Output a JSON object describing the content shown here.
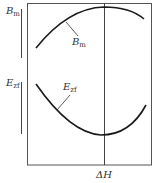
{
  "diagram": {
    "type": "qualitative-curve-diagram",
    "x_axis": {
      "marker_label": "ΔH",
      "marker_label_main": "ΔH"
    },
    "y_axis_labels": [
      {
        "main": "B",
        "sub": "m"
      },
      {
        "main": "E",
        "sub": "zf"
      }
    ],
    "curves": [
      {
        "name": "B_m",
        "label_main": "B",
        "label_sub": "m",
        "shape": "concave-down, maximum at ΔH"
      },
      {
        "name": "E_zf",
        "label_main": "E",
        "label_sub": "zf",
        "shape": "concave-up, minimum at ΔH"
      }
    ],
    "colors": {
      "line": "#222222",
      "frame": "#444444",
      "text": "#333333"
    }
  }
}
